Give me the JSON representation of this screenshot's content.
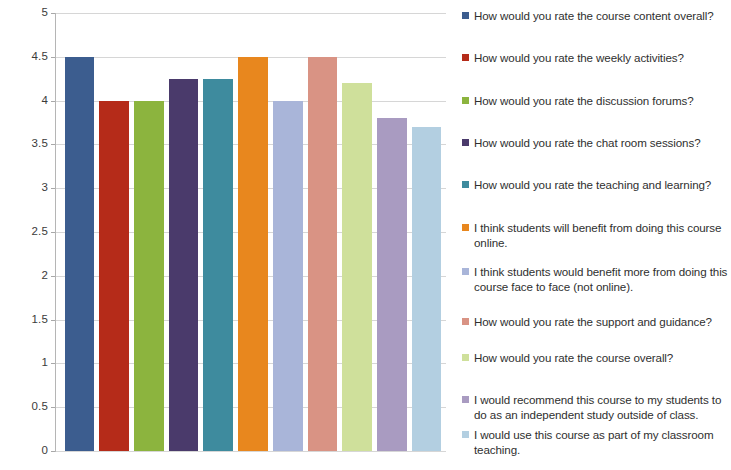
{
  "chart_data": {
    "type": "bar",
    "title": "",
    "xlabel": "",
    "ylabel": "",
    "ylim": [
      0,
      5
    ],
    "ytick_step": 0.5,
    "ytick_labels": [
      "5",
      "4.5",
      "4",
      "3.5",
      "3",
      "2.5",
      "2",
      "1.5",
      "1",
      "0.5",
      "0"
    ],
    "ytick_values": [
      5,
      4.5,
      4,
      3.5,
      3,
      2.5,
      2,
      1.5,
      1,
      0.5,
      0
    ],
    "grid": true,
    "legend_position": "right",
    "xtick_labels": [],
    "categories": [
      "How would you rate the course content overall?",
      "How would you rate the weekly activities?",
      "How would you rate the discussion forums?",
      "How would you rate the chat room sessions?",
      "How would you rate the teaching and learning?",
      "I think students will benefit from doing this course online.",
      "I think students would benefit more from doing this course face to face (not online).",
      "How would you rate the support and guidance?",
      "How would you rate the course overall?",
      "I would recommend this course to my students to do as an independent study outside of class.",
      "I would use this course as part of my classroom teaching."
    ],
    "values": [
      4.5,
      4.0,
      4.0,
      4.25,
      4.25,
      4.5,
      4.0,
      4.5,
      4.2,
      3.8,
      3.7
    ],
    "colors": [
      "#3c5d8f",
      "#b52b19",
      "#8cb43e",
      "#4a3a6b",
      "#3e8b9e",
      "#e8871e",
      "#a9b5d9",
      "#d99384",
      "#cfe09b",
      "#a99bc1",
      "#b3cfe1"
    ]
  },
  "legend": {
    "items": [
      {
        "label": "How would you rate the course content overall?",
        "color": "#3c5d8f"
      },
      {
        "label": "How would you rate the weekly activities?",
        "color": "#b52b19"
      },
      {
        "label": "How would you rate the discussion forums?",
        "color": "#8cb43e"
      },
      {
        "label": "How would you rate the chat room sessions?",
        "color": "#4a3a6b"
      },
      {
        "label": "How would you rate the teaching and learning?",
        "color": "#3e8b9e"
      },
      {
        "label": "I think students will benefit from doing this course online.",
        "color": "#e8871e"
      },
      {
        "label": "I think students would benefit more from doing this course face to face (not online).",
        "color": "#a9b5d9"
      },
      {
        "label": "How would you rate the support and guidance?",
        "color": "#d99384"
      },
      {
        "label": "How would you rate the course overall?",
        "color": "#cfe09b"
      },
      {
        "label": "I would recommend this course to my students to do as an independent study outside of class.",
        "color": "#a99bc1"
      },
      {
        "label": "I would use this course as part of my classroom teaching.",
        "color": "#b3cfe1"
      }
    ]
  }
}
